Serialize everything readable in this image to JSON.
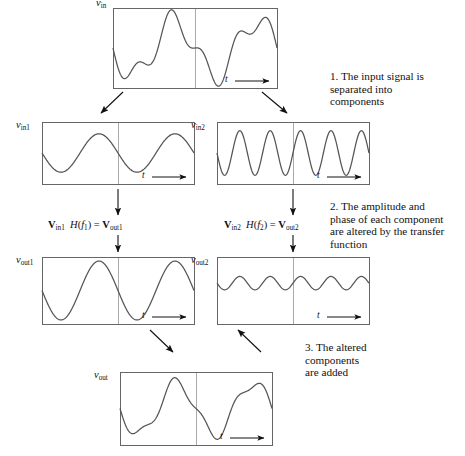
{
  "axis_label_t": "t",
  "panels": [
    {
      "id": "vin",
      "ylabel_var": "v",
      "ylabel_sub": "in",
      "xlabel": "t",
      "box": {
        "x": 113,
        "y": 8,
        "width": 164,
        "height": 80
      },
      "midline_frac": 0.5
    },
    {
      "id": "vin1",
      "ylabel_var": "v",
      "ylabel_sub": "in1",
      "xlabel": "t",
      "box": {
        "x": 42,
        "y": 122,
        "width": 152,
        "height": 62
      },
      "midline_frac": 0.5
    },
    {
      "id": "vin2",
      "ylabel_var": "v",
      "ylabel_sub": "in2",
      "xlabel": "t",
      "box": {
        "x": 217,
        "y": 122,
        "width": 152,
        "height": 62
      },
      "midline_frac": 0.5
    },
    {
      "id": "vout1",
      "ylabel_var": "v",
      "ylabel_sub": "out1",
      "xlabel": "t",
      "box": {
        "x": 42,
        "y": 257,
        "width": 152,
        "height": 67
      },
      "midline_frac": 0.5
    },
    {
      "id": "vout2",
      "ylabel_var": "v",
      "ylabel_sub": "out2",
      "xlabel": "t",
      "box": {
        "x": 217,
        "y": 257,
        "width": 152,
        "height": 67
      },
      "midline_frac": 0.5
    },
    {
      "id": "vout",
      "ylabel_var": "v",
      "ylabel_sub": "out",
      "xlabel": "t",
      "box": {
        "x": 120,
        "y": 372,
        "width": 152,
        "height": 73
      },
      "midline_frac": 0.5
    }
  ],
  "equations": [
    {
      "id": "eq-left",
      "bold1": "V",
      "sub1": "in1",
      "fn": "H",
      "fn_var": "f",
      "fn_sub": "1",
      "equals": "=",
      "bold2": "V",
      "sub2": "out1"
    },
    {
      "id": "eq-right",
      "bold1": "V",
      "sub1": "in2",
      "fn": "H",
      "fn_var": "f",
      "fn_sub": "2",
      "equals": "=",
      "bold2": "V",
      "sub2": "out2"
    }
  ],
  "notes": [
    {
      "id": "note-1",
      "number": "1.",
      "text": "1. The input signal is\nseparated into\ncomponents"
    },
    {
      "id": "note-2",
      "number": "2.",
      "text": "2. The amplitude and\nphase of each component\nare altered by the transfer\nfunction"
    },
    {
      "id": "note-3",
      "number": "3.",
      "text": "3. The altered\ncomponents\nare added"
    }
  ],
  "colors": {
    "frame": "#666666",
    "curve": "#555555",
    "midline": "#aaaaaa",
    "arrow": "#111111",
    "text": "#111111",
    "background": "#ffffff"
  },
  "chart_data": {
    "type": "line",
    "xlabel": "t",
    "ylabel": "v",
    "grid": false,
    "legend": "none",
    "series": [
      {
        "name": "v_in",
        "panel": "vin",
        "description": "Sum of a low-frequency large sine and a higher-frequency smaller sine",
        "components": [
          {
            "amplitude": 1.0,
            "cycles": 2.0,
            "phase_deg": 90,
            "offset": 0.0
          },
          {
            "amplitude": 0.42,
            "cycles": 5.0,
            "phase_deg": 90,
            "offset": 0.0
          }
        ],
        "ylim": [
          -1.45,
          1.45
        ]
      },
      {
        "name": "v_in1",
        "panel": "vin1",
        "description": "Low-frequency component of the input",
        "components": [
          {
            "amplitude": 0.62,
            "cycles": 2.0,
            "phase_deg": 90,
            "offset": 0.0
          }
        ],
        "ylim": [
          -1.0,
          1.0
        ]
      },
      {
        "name": "v_in2",
        "panel": "vin2",
        "description": "High-frequency component of the input",
        "components": [
          {
            "amplitude": 0.72,
            "cycles": 5.0,
            "phase_deg": 90,
            "offset": 0.0
          }
        ],
        "ylim": [
          -1.0,
          1.0
        ]
      },
      {
        "name": "v_out1",
        "panel": "vout1",
        "description": "Low-frequency component after the transfer function, amplitude increased",
        "components": [
          {
            "amplitude": 0.88,
            "cycles": 2.0,
            "phase_deg": 90,
            "offset": 0.0
          }
        ],
        "ylim": [
          -1.0,
          1.0
        ]
      },
      {
        "name": "v_out2",
        "panel": "vout2",
        "description": "High-frequency component after the transfer function, amplitude reduced and shifted up",
        "components": [
          {
            "amplitude": 0.2,
            "cycles": 5.0,
            "phase_deg": 90,
            "offset": 0.22
          }
        ],
        "ylim": [
          -1.0,
          1.0
        ]
      },
      {
        "name": "v_out",
        "panel": "vout",
        "description": "Sum of the altered components",
        "components": [
          {
            "amplitude": 0.88,
            "cycles": 2.0,
            "phase_deg": 90,
            "offset": 0.0
          },
          {
            "amplitude": 0.2,
            "cycles": 5.0,
            "phase_deg": 90,
            "offset": 0.0
          }
        ],
        "ylim": [
          -1.25,
          1.25
        ]
      }
    ]
  },
  "arrows": [
    {
      "id": "split-left",
      "x1": 123,
      "y1": 92,
      "x2": 101,
      "y2": 113,
      "kind": "diagonal"
    },
    {
      "id": "split-right",
      "x1": 262,
      "y1": 92,
      "x2": 287,
      "y2": 113,
      "kind": "diagonal"
    },
    {
      "id": "tf-left",
      "x1": 118,
      "y1": 189,
      "x2": 118,
      "y2": 215,
      "kind": "vertical"
    },
    {
      "id": "tf-right",
      "x1": 293,
      "y1": 189,
      "x2": 293,
      "y2": 215,
      "kind": "vertical"
    },
    {
      "id": "apply-left",
      "x1": 118,
      "y1": 235,
      "x2": 118,
      "y2": 252,
      "kind": "vertical"
    },
    {
      "id": "apply-right",
      "x1": 293,
      "y1": 235,
      "x2": 293,
      "y2": 252,
      "kind": "vertical"
    },
    {
      "id": "sum-left",
      "x1": 150,
      "y1": 330,
      "x2": 173,
      "y2": 352,
      "kind": "diagonal"
    },
    {
      "id": "sum-right",
      "x1": 261,
      "y1": 352,
      "x2": 238,
      "y2": 330,
      "kind": "diagonal-rev"
    }
  ]
}
